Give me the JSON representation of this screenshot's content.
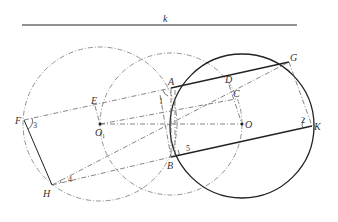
{
  "figure": {
    "line_label": "k",
    "points": {
      "A": "A",
      "B": "B",
      "C": "C",
      "D": "D",
      "E": "E",
      "F": "F",
      "G": "G",
      "H": "H",
      "K": "K",
      "O": "O",
      "O1_main": "O",
      "O1_sub": "1"
    },
    "angles": {
      "a1": "1",
      "a2": "2",
      "a3": "3",
      "a4": "4",
      "a5": "5"
    },
    "colors": {
      "solid": "#222222",
      "dashed": "#666666"
    }
  }
}
